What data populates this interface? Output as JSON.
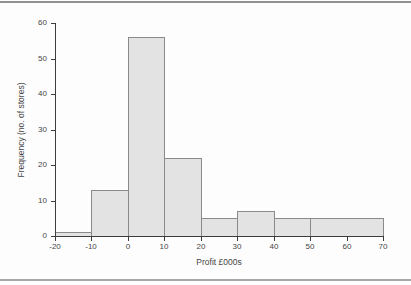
{
  "figure": {
    "background": "#fdfdfd",
    "top_rule_color": "#8f9193",
    "bottom_rule_color": "#a6a8aa"
  },
  "chart_data": {
    "type": "bar",
    "subtype": "histogram",
    "title": "",
    "xlabel": "Profit £000s",
    "ylabel": "Frequency (no. of stores)",
    "xlim": [
      -20,
      70
    ],
    "ylim": [
      0,
      60
    ],
    "grid": false,
    "legend": "none",
    "bins": [
      {
        "from": -20,
        "to": -10,
        "frequency": 1
      },
      {
        "from": -10,
        "to": 0,
        "frequency": 13
      },
      {
        "from": 0,
        "to": 10,
        "frequency": 56
      },
      {
        "from": 10,
        "to": 20,
        "frequency": 22
      },
      {
        "from": 20,
        "to": 30,
        "frequency": 5
      },
      {
        "from": 30,
        "to": 40,
        "frequency": 7
      },
      {
        "from": 40,
        "to": 50,
        "frequency": 5
      },
      {
        "from": 50,
        "to": 70,
        "frequency": 5
      }
    ],
    "x_ticks": [
      -20,
      -10,
      0,
      10,
      20,
      30,
      40,
      50,
      60,
      70
    ],
    "y_ticks": [
      0,
      10,
      20,
      30,
      40,
      50,
      60
    ],
    "bar_fill": "#e3e3e3",
    "bar_border": "#8a8a8a",
    "axis_color": "#3d3d3d",
    "text_color": "#464646"
  }
}
